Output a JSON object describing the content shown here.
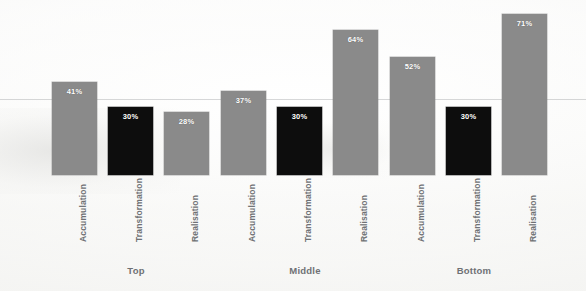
{
  "chart_data": {
    "type": "bar",
    "title": "",
    "subtitle": "",
    "xlabel": "",
    "ylabel": "",
    "ylim": [
      0,
      100
    ],
    "grid": false,
    "legend": false,
    "categories": [
      "Accumulation",
      "Transformation",
      "Realisation"
    ],
    "groups": [
      "Top",
      "Middle",
      "Bottom"
    ],
    "bars": [
      {
        "group": "Top",
        "category": "Accumulation",
        "value": 41,
        "label": "41%",
        "color": "#8a8a8a",
        "style": "gray"
      },
      {
        "group": "Top",
        "category": "Transformation",
        "value": 30,
        "label": "30%",
        "color": "#0d0d0d",
        "style": "black"
      },
      {
        "group": "Top",
        "category": "Realisation",
        "value": 28,
        "label": "28%",
        "color": "#8a8a8a",
        "style": "gray"
      },
      {
        "group": "Middle",
        "category": "Accumulation",
        "value": 37,
        "label": "37%",
        "color": "#8a8a8a",
        "style": "gray"
      },
      {
        "group": "Middle",
        "category": "Transformation",
        "value": 30,
        "label": "30%",
        "color": "#0d0d0d",
        "style": "black"
      },
      {
        "group": "Middle",
        "category": "Realisation",
        "value": 64,
        "label": "64%",
        "color": "#8a8a8a",
        "style": "gray"
      },
      {
        "group": "Bottom",
        "category": "Accumulation",
        "value": 52,
        "label": "52%",
        "color": "#8a8a8a",
        "style": "gray"
      },
      {
        "group": "Bottom",
        "category": "Transformation",
        "value": 30,
        "label": "30%",
        "color": "#0d0d0d",
        "style": "black"
      },
      {
        "group": "Bottom",
        "category": "Realisation",
        "value": 71,
        "label": "71%",
        "color": "#8a8a8a",
        "style": "gray"
      }
    ],
    "series": [
      {
        "name": "Accumulation",
        "values": [
          41,
          37,
          52
        ]
      },
      {
        "name": "Transformation",
        "values": [
          30,
          30,
          30
        ]
      },
      {
        "name": "Realisation",
        "values": [
          28,
          64,
          71
        ]
      }
    ]
  },
  "colors": {
    "bar_gray": "#8a8a8a",
    "bar_black": "#0d0d0d",
    "label_text": "#6f7174",
    "value_text": "#ffffff",
    "background": "#fbfbfa"
  },
  "layout": {
    "baseline_y": 175,
    "max_bar_height": 161,
    "bar_width": 45,
    "bar_x": [
      52,
      108,
      164,
      221,
      277,
      333,
      390,
      446,
      502
    ],
    "group_label_x": [
      136,
      305,
      474
    ],
    "group_label_y": 266,
    "category_label_y": 180,
    "gridline_y": 99
  }
}
